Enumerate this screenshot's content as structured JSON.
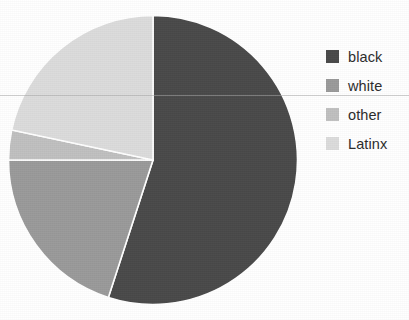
{
  "chart_data": {
    "type": "pie",
    "title": "",
    "labels": [
      "black",
      "white",
      "other",
      "Latinx"
    ],
    "values": [
      55,
      20,
      3,
      22
    ],
    "units": "percent",
    "start_angle_deg": 0,
    "direction": "clockwise",
    "colors": [
      "#494949",
      "#9a9a9a",
      "#c0c0c0",
      "#dcdcdc"
    ],
    "legend_position": "right",
    "grid": false,
    "slices": [
      {
        "label": "black",
        "value": 55,
        "color": "#494949",
        "start_deg": 0,
        "end_deg": 198
      },
      {
        "label": "white",
        "value": 20,
        "color": "#9a9a9a",
        "start_deg": 198,
        "end_deg": 270
      },
      {
        "label": "other",
        "value": 3,
        "color": "#c0c0c0",
        "start_deg": 270,
        "end_deg": 282
      },
      {
        "label": "Latinx",
        "value": 22,
        "color": "#dcdcdc",
        "start_deg": 282,
        "end_deg": 360
      }
    ]
  },
  "legend": {
    "items": [
      {
        "label": "black",
        "color": "#494949"
      },
      {
        "label": "white",
        "color": "#9a9a9a"
      },
      {
        "label": "other",
        "color": "#c0c0c0"
      },
      {
        "label": "Latinx",
        "color": "#dcdcdc"
      }
    ]
  },
  "figure": {
    "background": "#ffffff",
    "slice_edge_color": "#ffffff"
  }
}
